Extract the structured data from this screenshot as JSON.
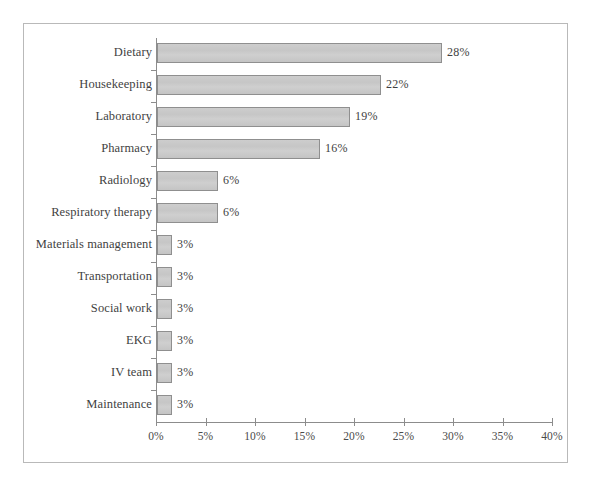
{
  "chart_data": {
    "type": "bar",
    "orientation": "horizontal",
    "title": "",
    "xlabel": "",
    "ylabel": "",
    "xlim": [
      0,
      40
    ],
    "xtick_labels": [
      "0%",
      "5%",
      "10%",
      "15%",
      "20%",
      "25%",
      "30%",
      "35%",
      "40%"
    ],
    "xtick_values": [
      0,
      5,
      10,
      15,
      20,
      25,
      30,
      35,
      40
    ],
    "grid": false,
    "legend": false,
    "bar_color": "#c9c9c9",
    "bar_edge_color": "#8f8f8f",
    "axis_color": "#8c8c8c",
    "categories": [
      "Dietary",
      "Housekeeping",
      "Laboratory",
      "Pharmacy",
      "Radiology",
      "Respiratory therapy",
      "Materials management",
      "Transportation",
      "Social work",
      "EKG",
      "IV team",
      "Maintenance"
    ],
    "values": [
      28,
      22,
      19,
      16,
      6,
      6,
      3,
      3,
      3,
      3,
      3,
      3
    ],
    "value_labels": [
      "28%",
      "22%",
      "19%",
      "16%",
      "6%",
      "6%",
      "3%",
      "3%",
      "3%",
      "3%",
      "3%",
      "3%"
    ],
    "bars": [
      {
        "label": "Dietary",
        "value": 28,
        "value_label": "28%",
        "px_width": 285
      },
      {
        "label": "Housekeeping",
        "value": 22,
        "value_label": "22%",
        "px_width": 224
      },
      {
        "label": "Laboratory",
        "value": 19,
        "value_label": "19%",
        "px_width": 193
      },
      {
        "label": "Pharmacy",
        "value": 16,
        "value_label": "16%",
        "px_width": 163
      },
      {
        "label": "Radiology",
        "value": 6,
        "value_label": "6%",
        "px_width": 61
      },
      {
        "label": "Respiratory therapy",
        "value": 6,
        "value_label": "6%",
        "px_width": 61
      },
      {
        "label": "Materials management",
        "value": 3,
        "value_label": "3%",
        "px_width": 15
      },
      {
        "label": "Transportation",
        "value": 3,
        "value_label": "3%",
        "px_width": 15
      },
      {
        "label": "Social work",
        "value": 3,
        "value_label": "3%",
        "px_width": 15
      },
      {
        "label": "EKG",
        "value": 3,
        "value_label": "3%",
        "px_width": 15
      },
      {
        "label": "IV team",
        "value": 3,
        "value_label": "3%",
        "px_width": 15
      },
      {
        "label": "Maintenance",
        "value": 3,
        "value_label": "3%",
        "px_width": 15
      }
    ]
  }
}
